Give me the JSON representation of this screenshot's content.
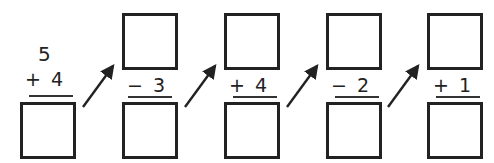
{
  "worksheet": {
    "start_number": "5",
    "steps": [
      {
        "operator": "+",
        "operand": "4",
        "label": "+ 4"
      },
      {
        "operator": "-",
        "operand": "3",
        "label": "− 3"
      },
      {
        "operator": "+",
        "operand": "4",
        "label": "+ 4"
      },
      {
        "operator": "-",
        "operand": "2",
        "label": "− 2"
      },
      {
        "operator": "+",
        "operand": "1",
        "label": "+ 1"
      }
    ],
    "answer_boxes": {
      "top": [
        "",
        "",
        "",
        ""
      ],
      "bottom": [
        "",
        "",
        "",
        "",
        ""
      ]
    },
    "colors": {
      "ink": "#222222",
      "background": "#ffffff"
    }
  }
}
